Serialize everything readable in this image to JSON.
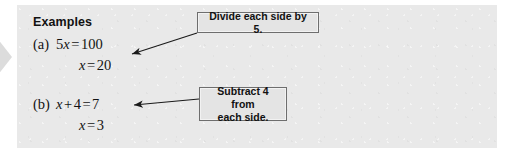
{
  "panel": {
    "heading": "Examples",
    "background_color": "#e9e9e9"
  },
  "decoration": {
    "left_chevron_icon": "chevron-right-icon",
    "color": "#d9d9d9"
  },
  "examples": [
    {
      "label": "(a)",
      "line1": {
        "coefficient": "5",
        "variable": "x",
        "equals": "=",
        "value": "100"
      },
      "line2": {
        "variable": "x",
        "equals": "=",
        "value": "20"
      },
      "line1_plain": "5x = 100",
      "line2_plain": "x = 20"
    },
    {
      "label": "(b)",
      "line1": {
        "variable": "x",
        "plus": "+",
        "addend": "4",
        "equals": "=",
        "value": "7"
      },
      "line2": {
        "variable": "x",
        "equals": "=",
        "value": "3"
      },
      "line1_plain": "x + 4 = 7",
      "line2_plain": "x = 3"
    }
  ],
  "callouts": [
    {
      "text": "Divide each side by 5.",
      "border_color": "#6e6e6e",
      "fill_color": "#e4e4e4"
    },
    {
      "text_line1": "Subtract 4 from",
      "text_line2": "each side.",
      "text": "Subtract 4 from each side.",
      "border_color": "#6e6e6e",
      "fill_color": "#e4e4e4"
    }
  ],
  "arrows": [
    {
      "name": "arrow-to-example-a",
      "color": "#1a1a1a"
    },
    {
      "name": "arrow-to-example-b",
      "color": "#1a1a1a"
    }
  ]
}
